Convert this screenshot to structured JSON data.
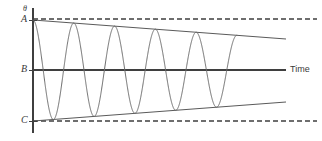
{
  "figure": {
    "caption_hidden": "",
    "background_color": "#ffffff",
    "stroke_color": "#555555",
    "axis_color": "#3a3a3a",
    "wave_color": "#6b6b6b"
  },
  "axes": {
    "y_axis_label": "θ",
    "x_axis_label": "Time",
    "y_tick_labels": [
      {
        "name": "A",
        "text": "A",
        "y_px": 20
      },
      {
        "name": "B",
        "text": "B",
        "y_px": 70
      },
      {
        "name": "C",
        "text": "C",
        "y_px": 121
      }
    ],
    "y_axis_x_px": 33,
    "y_axis_top_px": 8,
    "y_axis_bottom_px": 133,
    "x_axis_y_px": 70,
    "x_axis_start_px": 33,
    "x_axis_end_px": 286
  },
  "chart_data": {
    "type": "line",
    "title": "",
    "subtitle": "",
    "xlabel": "Time",
    "ylabel": "θ",
    "grid": false,
    "legend": null,
    "ytick_labels": [
      "A",
      "B",
      "C"
    ],
    "ytick_values": [
      1.0,
      0.0,
      -1.0
    ],
    "xlim": [
      0,
      10
    ],
    "ylim": [
      -1.12,
      1.12
    ],
    "series": [
      {
        "name": "damped-oscillation",
        "description": "Oscillation of constant period with linearly decaying amplitude, starting at A, oscillating about B, reaching C.",
        "start_amplitude": 1.0,
        "end_amplitude": 0.62,
        "cycles": 5,
        "phase": "cosine",
        "x_start_px": 33,
        "x_end_px": 237
      },
      {
        "name": "upper-envelope",
        "description": "Solid line from A sloping down to the right.",
        "x_start_px": 33,
        "y_start_px": 20,
        "x_end_px": 286,
        "y_end_px": 39
      },
      {
        "name": "lower-envelope",
        "description": "Solid line from C sloping up to the right.",
        "x_start_px": 33,
        "y_start_px": 121,
        "x_end_px": 286,
        "y_end_px": 102
      },
      {
        "name": "upper-dashed-reference",
        "description": "Horizontal dashed line at level A.",
        "x_start_px": 33,
        "y_px": 19,
        "x_end_px": 317
      },
      {
        "name": "lower-dashed-reference",
        "description": "Horizontal dashed line at level C.",
        "x_start_px": 33,
        "y_px": 121,
        "x_end_px": 317
      }
    ]
  }
}
